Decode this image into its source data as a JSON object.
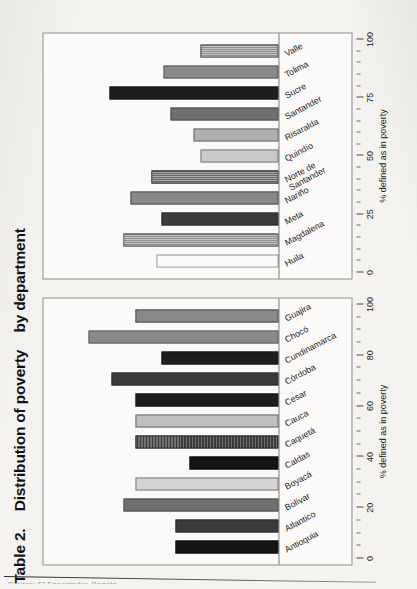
{
  "document": {
    "title_prefix": "Table 2.",
    "title_main": "Distribution of poverty",
    "title_suffix": "by department",
    "source_line": "Source: El Espectador, Bogota"
  },
  "chart_data": [
    {
      "id": "chart-a",
      "type": "bar",
      "title": "Distribution of poverty by department",
      "xlabel": "",
      "ylabel": "% defined as in poverty",
      "axis_label": "% defined as in poverty",
      "ylim": [
        0,
        100
      ],
      "ticks": [
        0,
        20,
        40,
        60,
        80,
        100
      ],
      "minor_tick_step": 5,
      "grid": false,
      "orientation": "vertical",
      "categories": [
        "Antioquia",
        "Atlantico",
        "Bolívar",
        "Boyacá",
        "Caldas",
        "Caquetá",
        "Cauca",
        "Cesar",
        "Córdoba",
        "Cundinamarca",
        "Chocó",
        "Guajira"
      ],
      "values": [
        44,
        44,
        66,
        61,
        38,
        61,
        61,
        61,
        71,
        50,
        81,
        61
      ],
      "fills": [
        "f-black",
        "f-dark",
        "f-mid",
        "f-lighter p-check",
        "f-black",
        "f-dark p-fine",
        "f-light p-check",
        "f-darkest p-dot",
        "f-dark",
        "f-darkest p-dot",
        "f-midlt",
        "f-mid p-check"
      ]
    },
    {
      "id": "chart-b",
      "type": "bar",
      "title": "Distribution of poverty by department",
      "xlabel": "",
      "ylabel": "% defined as in poverty",
      "axis_label": "% defined as in poverty",
      "ylim": [
        0,
        100
      ],
      "ticks": [
        0,
        25,
        50,
        75,
        100
      ],
      "minor_tick_step": 5,
      "grid": false,
      "orientation": "vertical",
      "categories": [
        "Huila",
        "Magdalena",
        "Meta",
        "Nariño",
        "Norte de Santander",
        "Quindío",
        "Risaralda",
        "Santander",
        "Sucre",
        "Tolima",
        "Valle"
      ],
      "values": [
        52,
        66,
        50,
        63,
        54,
        33,
        36,
        46,
        72,
        49,
        33
      ],
      "fills": [
        "f-white p-grid",
        "f-mid p-grid",
        "f-dark",
        "f-mid p-check",
        "f-dark p-grid",
        "f-lighter",
        "f-light",
        "f-mid",
        "f-darkest",
        "f-midlt",
        "f-mid p-grid"
      ]
    }
  ],
  "colors": {
    "page_background": "#f4f3f0",
    "frame_border": "#8c8c8c",
    "text": "#1b1b1b"
  }
}
